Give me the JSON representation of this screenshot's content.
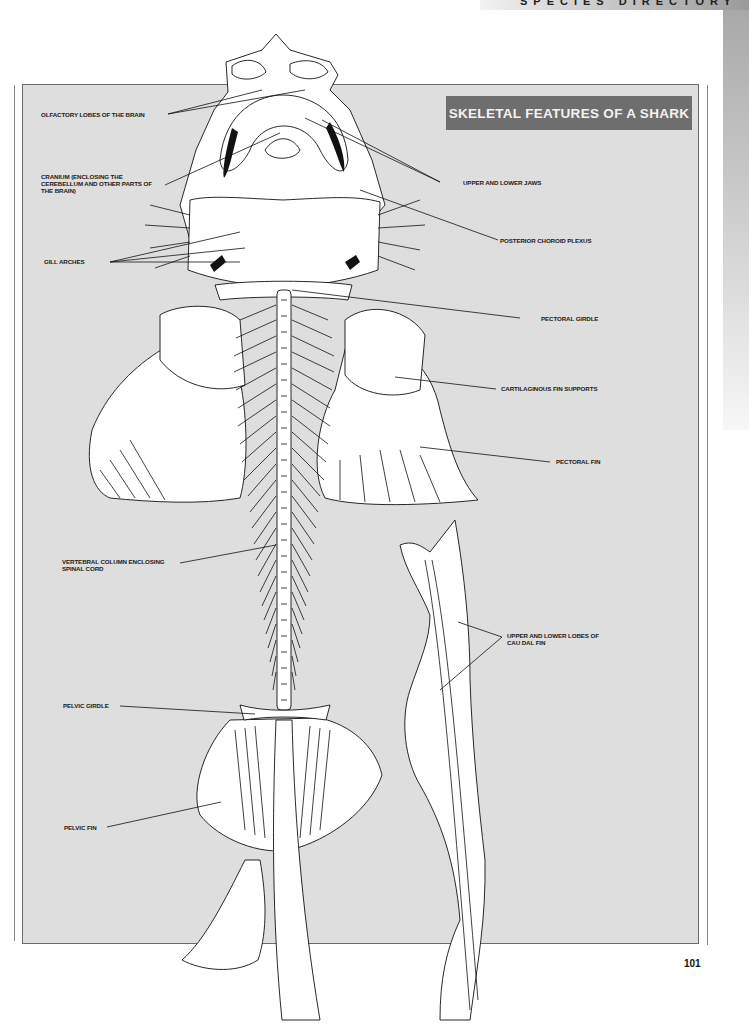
{
  "page": {
    "running_head": "SPECIES DIRECTORY",
    "page_number": "101"
  },
  "figure": {
    "title": "SKELETAL FEATURES OF A SHARK",
    "colors": {
      "panel_background": "#dedede",
      "title_box": "#6e6e6e",
      "title_text": "#f2f2f2",
      "line_art": "#111111",
      "bone_fill": "#ffffff"
    },
    "labels": {
      "left": [
        {
          "id": "olfactory-lobes",
          "text": "OLFACTORY LOBES OF THE BRAIN"
        },
        {
          "id": "cranium",
          "text": "CRANIUM (ENCLOSING THE\nCEREBELLUM AND OTHER PARTS OF\nTHE BRAIN)"
        },
        {
          "id": "gill-arches",
          "text": "GILL ARCHES"
        },
        {
          "id": "vertebral-column",
          "text": "VERTEBRAL COLUMN ENCLOSING\nSPINAL CORD"
        },
        {
          "id": "pelvic-girdle",
          "text": "PELVIC GIRDLE"
        },
        {
          "id": "pelvic-fin",
          "text": "PELVIC FIN"
        }
      ],
      "right": [
        {
          "id": "jaws",
          "text": "UPPER AND LOWER JAWS"
        },
        {
          "id": "choroid-plexus",
          "text": "POSTERIOR CHOROID PLEXUS"
        },
        {
          "id": "pectoral-girdle",
          "text": "PECTORAL GIRDLE"
        },
        {
          "id": "fin-supports",
          "text": "CARTILAGINOUS FIN SUPPORTS"
        },
        {
          "id": "pectoral-fin",
          "text": "PECTORAL FIN"
        },
        {
          "id": "caudal-fin",
          "text": "UPPER AND LOWER LOBES OF\nCAU DAL FIN"
        }
      ]
    }
  }
}
